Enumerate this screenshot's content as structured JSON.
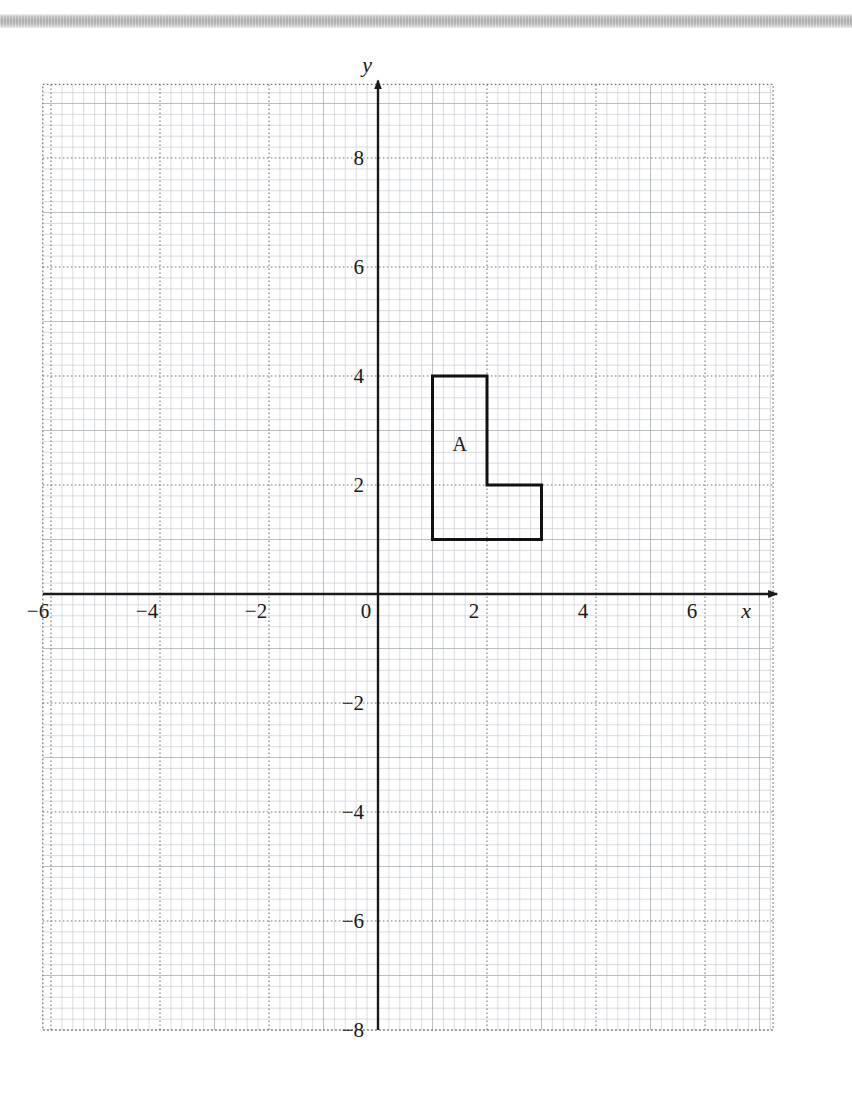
{
  "page": {
    "background_color": "#ffffff",
    "scan_band_color": "#b0b0b0"
  },
  "chart_data": {
    "type": "scatter",
    "title": "",
    "xlabel": "x",
    "ylabel": "y",
    "xlim": [
      -6.15,
      7.25
    ],
    "ylim": [
      -8.0,
      9.35
    ],
    "grid": true,
    "minor_grid": true,
    "minor_per_unit": 5,
    "x_ticks": [
      -6,
      -4,
      -2,
      0,
      2,
      4,
      6
    ],
    "x_tick_labels": [
      "−6",
      "−4",
      "−2",
      "0",
      "2",
      "4",
      "6"
    ],
    "y_ticks": [
      8,
      6,
      4,
      2,
      -2,
      -4,
      -6,
      -8
    ],
    "y_tick_labels": [
      "8",
      "6",
      "4",
      "2",
      "−2",
      "−4",
      "−6",
      "−8"
    ],
    "axis_arrows": [
      "x-positive",
      "y-positive"
    ],
    "shapes": [
      {
        "name": "A",
        "label": "A",
        "label_position": [
          1.5,
          2.75
        ],
        "stroke": "#111111",
        "stroke_width": 3,
        "fill": "none",
        "closed": true,
        "vertices": [
          [
            1,
            1
          ],
          [
            1,
            4
          ],
          [
            2,
            4
          ],
          [
            2,
            2
          ],
          [
            3,
            2
          ],
          [
            3,
            1
          ]
        ]
      }
    ],
    "colors": {
      "minor_grid": "#c9cdd4",
      "major_grid": "#6e6e6e",
      "axis": "#1a1a1a",
      "shape": "#111111"
    }
  },
  "axis_labels": {
    "x": "x",
    "y": "y"
  }
}
